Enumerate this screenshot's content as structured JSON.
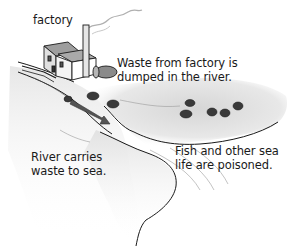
{
  "diagram": {
    "type": "illustration",
    "topic": "water pollution from a factory",
    "labels": {
      "factory": "factory",
      "waste_dumped": {
        "line1": "Waste from factory is",
        "line2": "dumped in the river."
      },
      "river_carries": {
        "line1": "River carries",
        "line2": "waste to sea."
      },
      "sea_life": {
        "line1": "Fish and other sea",
        "line2": "life are poisoned."
      }
    },
    "elements": [
      "factory-building",
      "smokestack",
      "smoke",
      "waste-tank",
      "pipe",
      "river",
      "flow-arrow",
      "land",
      "bushes",
      "sea"
    ],
    "colors": {
      "ink": "#1a1a1a",
      "arrow": "#555555",
      "land_shade": "#d9d9d9",
      "water": "#efefef",
      "background": "#ffffff"
    }
  }
}
